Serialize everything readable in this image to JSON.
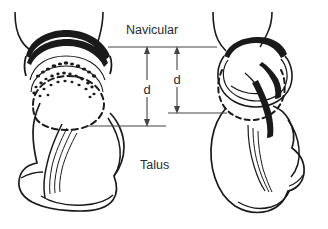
{
  "figure": {
    "background_color": "#ffffff",
    "ink_color": "#1a1a1a",
    "dimension_color": "#444444",
    "width": 328,
    "height": 229,
    "labels": {
      "navicular": "Navicular",
      "talus": "Talus",
      "dimension_left": "d",
      "dimension_right": "d"
    },
    "views": [
      {
        "id": "left-view",
        "name": "left-talus-navicular-view",
        "measurement_label": "d",
        "measurement_top_y": 47,
        "measurement_bottom_y": 126
      },
      {
        "id": "right-view",
        "name": "right-talus-navicular-view",
        "measurement_label": "d",
        "measurement_top_y": 47,
        "measurement_bottom_y": 113
      }
    ]
  }
}
